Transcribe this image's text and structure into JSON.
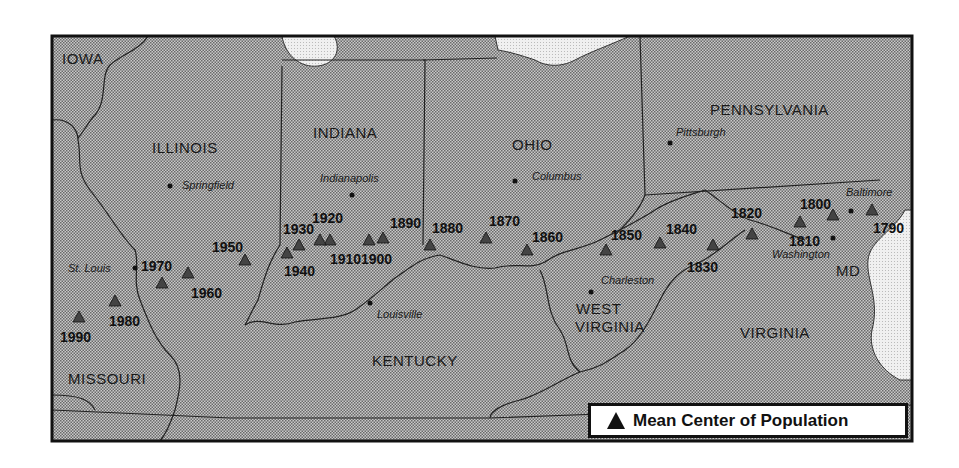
{
  "states": [
    {
      "name": "IOWA",
      "x": 62,
      "y": 64
    },
    {
      "name": "ILLINOIS",
      "x": 152,
      "y": 153
    },
    {
      "name": "INDIANA",
      "x": 313,
      "y": 138
    },
    {
      "name": "OHIO",
      "x": 512,
      "y": 150
    },
    {
      "name": "PENNSYLVANIA",
      "x": 710,
      "y": 115
    },
    {
      "name": "WEST",
      "x": 576,
      "y": 314
    },
    {
      "name": "VIRGINIA",
      "x": 575,
      "y": 332
    },
    {
      "name": "VIRGINIA",
      "x": 740,
      "y": 338
    },
    {
      "name": "KENTUCKY",
      "x": 372,
      "y": 366
    },
    {
      "name": "MISSOURI",
      "x": 68,
      "y": 384
    },
    {
      "name": "MD",
      "x": 836,
      "y": 276
    }
  ],
  "cities": [
    {
      "name": "Springfield",
      "dot": [
        170,
        186
      ],
      "x": 182,
      "y": 189
    },
    {
      "name": "Indianapolis",
      "dot": [
        352,
        195
      ],
      "x": 320,
      "y": 182
    },
    {
      "name": "Columbus",
      "dot": [
        515,
        181
      ],
      "x": 532,
      "y": 180
    },
    {
      "name": "Pittsburgh",
      "dot": [
        670,
        143
      ],
      "x": 676,
      "y": 136
    },
    {
      "name": "St. Louis",
      "dot": [
        135,
        268
      ],
      "x": 68,
      "y": 272
    },
    {
      "name": "Louisville",
      "dot": [
        370,
        303
      ],
      "x": 377,
      "y": 318
    },
    {
      "name": "Charleston",
      "dot": [
        591,
        292
      ],
      "x": 601,
      "y": 284
    },
    {
      "name": "Washington",
      "dot": [
        833,
        238
      ],
      "x": 772,
      "y": 258
    },
    {
      "name": "Baltimore",
      "dot": [
        851,
        211
      ],
      "x": 846,
      "y": 196
    }
  ],
  "legend": {
    "label": "Mean Center of Population",
    "symbol": "triangle"
  },
  "chart_data": {
    "type": "scatter",
    "title": "Mean Center of Population",
    "points": [
      {
        "year": "1790",
        "tri": [
          872,
          210
        ],
        "label": [
          873,
          233
        ]
      },
      {
        "year": "1800",
        "tri": [
          833,
          215
        ],
        "label": [
          800,
          209
        ]
      },
      {
        "year": "1810",
        "tri": [
          800,
          222
        ],
        "label": [
          789,
          246
        ]
      },
      {
        "year": "1820",
        "tri": [
          752,
          234
        ],
        "label": [
          731,
          218
        ]
      },
      {
        "year": "1830",
        "tri": [
          713,
          245
        ],
        "label": [
          687,
          272
        ]
      },
      {
        "year": "1840",
        "tri": [
          660,
          243
        ],
        "label": [
          666,
          234
        ]
      },
      {
        "year": "1850",
        "tri": [
          606,
          250
        ],
        "label": [
          611,
          240
        ]
      },
      {
        "year": "1860",
        "tri": [
          527,
          250
        ],
        "label": [
          532,
          242
        ]
      },
      {
        "year": "1870",
        "tri": [
          486,
          238
        ],
        "label": [
          489,
          226
        ]
      },
      {
        "year": "1880",
        "tri": [
          430,
          245
        ],
        "label": [
          432,
          233
        ]
      },
      {
        "year": "1890",
        "tri": [
          383,
          238
        ],
        "label": [
          390,
          228
        ]
      },
      {
        "year": "1900",
        "tri": [
          369,
          240
        ],
        "label": [
          361,
          264
        ]
      },
      {
        "year": "1910",
        "tri": [
          330,
          240
        ],
        "label": [
          330,
          264
        ]
      },
      {
        "year": "1920",
        "tri": [
          320,
          240
        ],
        "label": [
          312,
          223
        ]
      },
      {
        "year": "1930",
        "tri": [
          299,
          245
        ],
        "label": [
          283,
          234
        ]
      },
      {
        "year": "1940",
        "tri": [
          287,
          253
        ],
        "label": [
          284,
          276
        ]
      },
      {
        "year": "1950",
        "tri": [
          245,
          260
        ],
        "label": [
          212,
          252
        ]
      },
      {
        "year": "1960",
        "tri": [
          188,
          273
        ],
        "label": [
          191,
          298
        ]
      },
      {
        "year": "1970",
        "tri": [
          162,
          283
        ],
        "label": [
          141,
          271
        ]
      },
      {
        "year": "1980",
        "tri": [
          115,
          301
        ],
        "label": [
          109,
          326
        ]
      },
      {
        "year": "1990",
        "tri": [
          79,
          317
        ],
        "label": [
          60,
          342
        ]
      }
    ]
  }
}
